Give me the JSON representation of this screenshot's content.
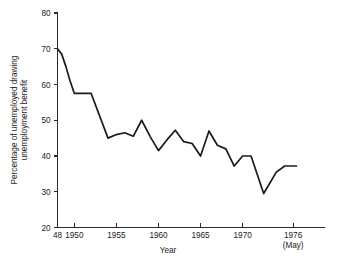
{
  "chart_data": {
    "type": "line",
    "title": "",
    "xlabel": "Year",
    "ylabel": "Percentage of unemployed drawing unemployment benefit",
    "ylabel_line1": "Percentage of unemployed drawing",
    "ylabel_line2": "unemployment benefit",
    "xlim": [
      1948,
      1976.4
    ],
    "ylim": [
      20,
      80
    ],
    "grid": false,
    "legend": false,
    "y_ticks": [
      20,
      30,
      40,
      50,
      60,
      70,
      80
    ],
    "y_tick_labels": [
      "20",
      "30",
      "40",
      "50",
      "60",
      "70",
      "80"
    ],
    "x_ticks": [
      1948,
      1950,
      1955,
      1960,
      1965,
      1970,
      1976
    ],
    "x_tick_labels": [
      "48",
      "1950",
      "1955",
      "1960",
      "1965",
      "1970",
      "1976"
    ],
    "x_tick_sublabels": [
      "",
      "",
      "",
      "",
      "",
      "",
      "(May)"
    ],
    "series": [
      {
        "name": "Percentage of unemployed drawing unemployment benefit",
        "color": "#1a1a1a",
        "x": [
          1948,
          1948.5,
          1949,
          1949.5,
          1950,
          1952,
          1954,
          1955,
          1956,
          1957,
          1958,
          1959,
          1960,
          1961,
          1962,
          1963,
          1964,
          1965,
          1966,
          1967,
          1968,
          1969,
          1970,
          1971,
          1972.5,
          1974,
          1975,
          1976.4
        ],
        "y": [
          70.0,
          68.5,
          65.0,
          61.0,
          57.5,
          57.5,
          45.0,
          46.0,
          46.5,
          45.5,
          50.0,
          45.5,
          41.5,
          44.5,
          47.2,
          44.0,
          43.5,
          40.0,
          47.0,
          43.0,
          42.0,
          37.2,
          40.0,
          40.0,
          29.5,
          35.5,
          37.2,
          37.2
        ]
      }
    ],
    "annotations": {
      "x_axis_note": "(May)"
    }
  }
}
